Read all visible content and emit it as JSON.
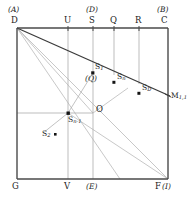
{
  "figure": {
    "colors": {
      "frame": "#4a4a4a",
      "grid": "#9a9a9a",
      "diagonal_dark": "#3a3a3a",
      "diagonal_light": "#a5a5a5",
      "point": "#1a1a1a",
      "text": "#1a1a1a",
      "background": "#ffffff"
    }
  },
  "corners": {
    "top_left": {
      "label": "D",
      "alt_label": "(A)"
    },
    "top_right": {
      "label": "C",
      "alt_label": "(B)"
    },
    "bottom_left": {
      "label": "G",
      "alt_label": ""
    },
    "bottom_right": {
      "label": "F",
      "alt_label": "(I)"
    }
  },
  "top_edge_marks": [
    {
      "label": "U",
      "alt_label": ""
    },
    {
      "label": "S",
      "alt_label": "(D)"
    },
    {
      "label": "Q",
      "alt_label": ""
    },
    {
      "label": "R",
      "alt_label": ""
    }
  ],
  "bottom_edge_marks": [
    {
      "label": "V",
      "alt_label": ""
    },
    {
      "label": "",
      "alt_label": "(E)"
    }
  ],
  "interior_points": [
    {
      "base": "S",
      "sub": "1",
      "alt_label": "(Q)"
    },
    {
      "base": "S",
      "sub": "n",
      "alt_label": ""
    },
    {
      "base": "S",
      "sub": "D",
      "alt_label": ""
    },
    {
      "base": "S",
      "sub": "n-1",
      "alt_label": ""
    },
    {
      "base": "S",
      "sub": "2",
      "alt_label": ""
    },
    {
      "base": "O",
      "sub": "",
      "alt_label": ""
    },
    {
      "base": "M",
      "sub": "1,1",
      "alt_label": ""
    }
  ],
  "labels": {
    "corner_D": "D",
    "corner_D_alt": "(A)",
    "corner_C": "C",
    "corner_C_alt": "(B)",
    "corner_G": "G",
    "corner_F": "F",
    "corner_F_alt": "(I)",
    "mark_U": "U",
    "mark_S": "S",
    "mark_S_alt": "(D)",
    "mark_Q": "Q",
    "mark_R": "R",
    "mark_V": "V",
    "mark_E_alt": "(E)",
    "point_O": "O",
    "point_S1_base": "S",
    "point_S1_sub": "1",
    "point_S1_alt": "(Q)",
    "point_Sn_base": "S",
    "point_Sn_sub": "n",
    "point_SD_base": "S",
    "point_SD_sub": "D",
    "point_Sn1_base": "S",
    "point_Sn1_sub": "n-1",
    "point_S2_base": "S",
    "point_S2_sub": "2",
    "point_M_base": "M",
    "point_M_sub": "1,1"
  }
}
